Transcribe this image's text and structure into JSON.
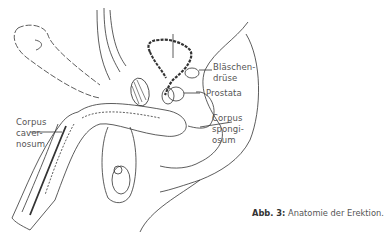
{
  "figure": {
    "caption_prefix": "Abb. 3:",
    "caption_text": " Anatomie der Erektion.",
    "labels": {
      "blaeschendruese_1": "Bläschen-",
      "blaeschendruese_2": "drüse",
      "prostata": "Prostata",
      "corpus_spongiosum_1": "Corpus",
      "corpus_spongiosum_2": "spongi-",
      "corpus_spongiosum_3": "osum",
      "corpus_cavernosum_1": "Corpus",
      "corpus_cavernosum_2": "caver-",
      "corpus_cavernosum_3": "nosum"
    },
    "colors": {
      "line": "#333333",
      "text": "#555555",
      "background": "#ffffff"
    }
  }
}
